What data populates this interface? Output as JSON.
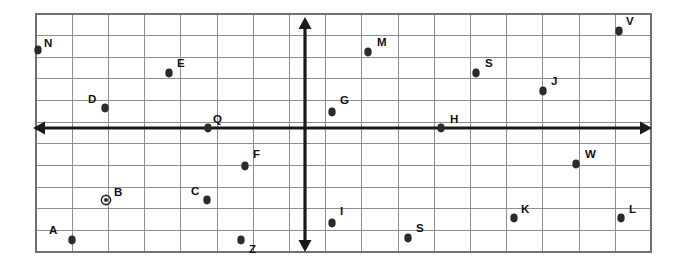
{
  "figure": {
    "background_color": "#ffffff",
    "grid_color": "#8e8e92",
    "frame_color": "#6f6f74",
    "axis_color": "#1a1a1a",
    "point_color": "#2b2b2b",
    "label_color": "#111111"
  },
  "grid": {
    "left": 36,
    "top": 14,
    "right": 651,
    "bottom": 252,
    "columns": 17,
    "rows": 11,
    "cell_width": 36.2,
    "cell_height": 21.6,
    "x_lines": [
      36,
      72.2,
      108.4,
      144.6,
      180.8,
      217,
      253.2,
      289.4,
      325.6,
      361.8,
      398,
      434.2,
      470.4,
      506.6,
      542.8,
      579,
      615.2,
      651
    ],
    "y_lines": [
      14,
      35.6,
      57.3,
      78.9,
      100.5,
      122.2,
      143.8,
      165.5,
      187.1,
      208.7,
      230.4,
      252
    ]
  },
  "axes": {
    "x_axis": {
      "label": "x-axis",
      "pixel_y": 128,
      "start_x": 33,
      "end_x": 652,
      "arrow_left": true,
      "arrow_right": true
    },
    "y_axis": {
      "label": "y-axis",
      "pixel_x": 305,
      "start_y": 17,
      "end_y": 252,
      "arrow_up": true,
      "arrow_down": true
    },
    "origin": {
      "x": 305,
      "y": 128
    }
  },
  "chart_data": {
    "type": "scatter",
    "xlabel": "",
    "ylabel": "",
    "grid": true,
    "legend": "none",
    "marker_styles": [
      "filled-dot",
      "ring-dot"
    ],
    "points": [
      {
        "label": "N",
        "px": 38,
        "py": 50,
        "label_px": 44,
        "label_py": 47,
        "marker": "filled-dot",
        "gx": -7.4,
        "gy": 3.6
      },
      {
        "label": "E",
        "px": 169,
        "py": 73,
        "label_px": 177,
        "label_py": 67,
        "marker": "filled-dot",
        "gx": -3.8,
        "gy": 2.5
      },
      {
        "label": "D",
        "px": 105,
        "py": 108,
        "label_px": 88,
        "label_py": 103,
        "marker": "filled-dot",
        "gx": -5.5,
        "gy": 0.9
      },
      {
        "label": "Q",
        "px": 208,
        "py": 128,
        "label_px": 213,
        "label_py": 123,
        "marker": "filled-dot",
        "gx": -2.7,
        "gy": 0.0
      },
      {
        "label": "M",
        "px": 368,
        "py": 52,
        "label_px": 377,
        "label_py": 46,
        "marker": "filled-dot",
        "gx": 1.7,
        "gy": 3.5
      },
      {
        "label": "S",
        "px": 476,
        "py": 73,
        "label_px": 485,
        "label_py": 67,
        "marker": "filled-dot",
        "gx": 4.7,
        "gy": 2.5
      },
      {
        "label": "J",
        "px": 543,
        "py": 91,
        "label_px": 551,
        "label_py": 85,
        "marker": "filled-dot",
        "gx": 6.6,
        "gy": 1.7
      },
      {
        "label": "V",
        "px": 619,
        "py": 31,
        "label_px": 626,
        "label_py": 25,
        "marker": "filled-dot",
        "gx": 8.7,
        "gy": 4.5
      },
      {
        "label": "G",
        "px": 332,
        "py": 112,
        "label_px": 340,
        "label_py": 104,
        "marker": "filled-dot",
        "gx": 0.7,
        "gy": 0.7
      },
      {
        "label": "H",
        "px": 441,
        "py": 128,
        "label_px": 450,
        "label_py": 123,
        "marker": "filled-dot",
        "gx": 3.8,
        "gy": 0.0
      },
      {
        "label": "F",
        "px": 245,
        "py": 166,
        "label_px": 253,
        "label_py": 158,
        "marker": "filled-dot",
        "gx": -1.7,
        "gy": -1.8
      },
      {
        "label": "W",
        "px": 576,
        "py": 164,
        "label_px": 585,
        "label_py": 158,
        "marker": "filled-dot",
        "gx": 7.5,
        "gy": -1.7
      },
      {
        "label": "B",
        "px": 106,
        "py": 200,
        "label_px": 114,
        "label_py": 196,
        "marker": "ring-dot",
        "gx": -5.5,
        "gy": -3.3
      },
      {
        "label": "C",
        "px": 207,
        "py": 200,
        "label_px": 191,
        "label_py": 195,
        "marker": "filled-dot",
        "gx": -2.7,
        "gy": -3.3
      },
      {
        "label": "I",
        "px": 332,
        "py": 223,
        "label_px": 340,
        "label_py": 215,
        "marker": "filled-dot",
        "gx": 0.7,
        "gy": -4.4
      },
      {
        "label": "K",
        "px": 514,
        "py": 218,
        "label_px": 521,
        "label_py": 213,
        "marker": "filled-dot",
        "gx": 5.8,
        "gy": -4.2
      },
      {
        "label": "L",
        "px": 621,
        "py": 218,
        "label_px": 629,
        "label_py": 213,
        "marker": "filled-dot",
        "gx": 8.7,
        "gy": -4.2
      },
      {
        "label": "A",
        "px": 72,
        "py": 240,
        "label_px": 49,
        "label_py": 234,
        "marker": "filled-dot",
        "gx": -6.4,
        "gy": -5.2
      },
      {
        "label": "Z",
        "px": 241,
        "py": 240,
        "label_px": 249,
        "label_py": 253,
        "marker": "filled-dot",
        "gx": -1.8,
        "gy": -5.2
      },
      {
        "label": "S",
        "px": 408,
        "py": 238,
        "label_px": 416,
        "label_py": 232,
        "marker": "filled-dot",
        "gx": 2.8,
        "gy": -5.1
      }
    ]
  }
}
